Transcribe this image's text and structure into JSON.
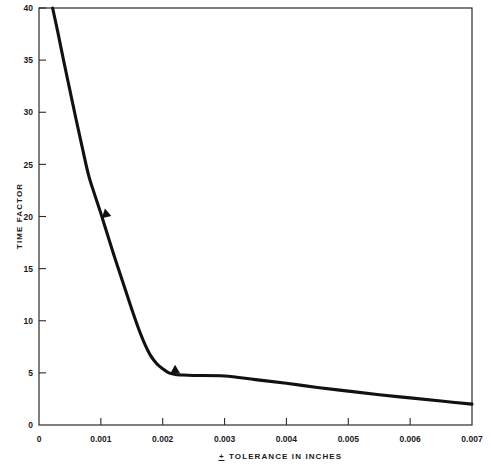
{
  "chart_data": {
    "type": "line",
    "title": "",
    "subtitle": "",
    "xlabel": "± TOLERANCE IN INCHES",
    "xlabel_symbol": "+",
    "xlabel_text": "TOLERANCE IN INCHES",
    "ylabel": "TIME FACTOR",
    "xlim": [
      0,
      0.007
    ],
    "ylim": [
      0,
      40
    ],
    "grid": false,
    "legend": null,
    "legend_position": "none",
    "x_ticks": [
      0,
      0.001,
      0.002,
      0.003,
      0.004,
      0.005,
      0.006,
      0.007
    ],
    "x_tick_labels": [
      "0",
      "0.001",
      "0.002",
      "0.003",
      "0.004",
      "0.005",
      "0.006",
      "0.007"
    ],
    "y_ticks": [
      0,
      5,
      10,
      15,
      20,
      25,
      30,
      35,
      40
    ],
    "y_tick_labels": [
      "0",
      "5",
      "10",
      "15",
      "20",
      "25",
      "30",
      "35",
      "40"
    ],
    "series": [
      {
        "name": "time factor vs tolerance",
        "color": "#111111",
        "x": [
          0.00022,
          0.0003,
          0.0004,
          0.0005,
          0.0006,
          0.0007,
          0.0008,
          0.0009,
          0.001,
          0.0011,
          0.0012,
          0.0013,
          0.0014,
          0.0015,
          0.0016,
          0.0017,
          0.0018,
          0.0019,
          0.002,
          0.0021,
          0.0022,
          0.0023,
          0.0025,
          0.003,
          0.0035,
          0.004,
          0.0045,
          0.005,
          0.0055,
          0.006,
          0.0065,
          0.007
        ],
        "y": [
          40,
          37.8,
          34.9,
          32.1,
          29.3,
          26.6,
          24.0,
          22.1,
          20.3,
          18.4,
          16.5,
          14.7,
          12.9,
          11.1,
          9.4,
          7.9,
          6.7,
          5.9,
          5.4,
          5.0,
          4.85,
          4.8,
          4.75,
          4.7,
          4.35,
          4.0,
          3.6,
          3.25,
          2.9,
          2.6,
          2.3,
          2.0
        ]
      }
    ],
    "annotations": [
      {
        "name": "direction-arrow-upper",
        "x": 0.00104,
        "y": 20.3,
        "shape": "triangle-right",
        "rotation": 18
      },
      {
        "name": "direction-arrow-lower",
        "x": 0.00216,
        "y": 5.35,
        "shape": "triangle-right",
        "rotation": 28
      }
    ]
  }
}
